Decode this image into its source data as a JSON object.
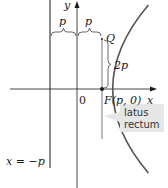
{
  "diagram": {
    "type": "parabola-focus-directrix",
    "labels": {
      "y_axis": "y",
      "x_axis": "x",
      "p_left": "p",
      "p_right": "p",
      "point_q": "Q",
      "two_p": "2p",
      "origin": "0",
      "focus": "F(p, 0)",
      "directrix": "x = −p",
      "latus_line1": "latus",
      "latus_line2": "rectum"
    },
    "colors": {
      "curve": "#555555",
      "axes": "#1a1a1a",
      "latus": "#bbbbbb",
      "callout_bg": "#e6e6e6"
    }
  }
}
